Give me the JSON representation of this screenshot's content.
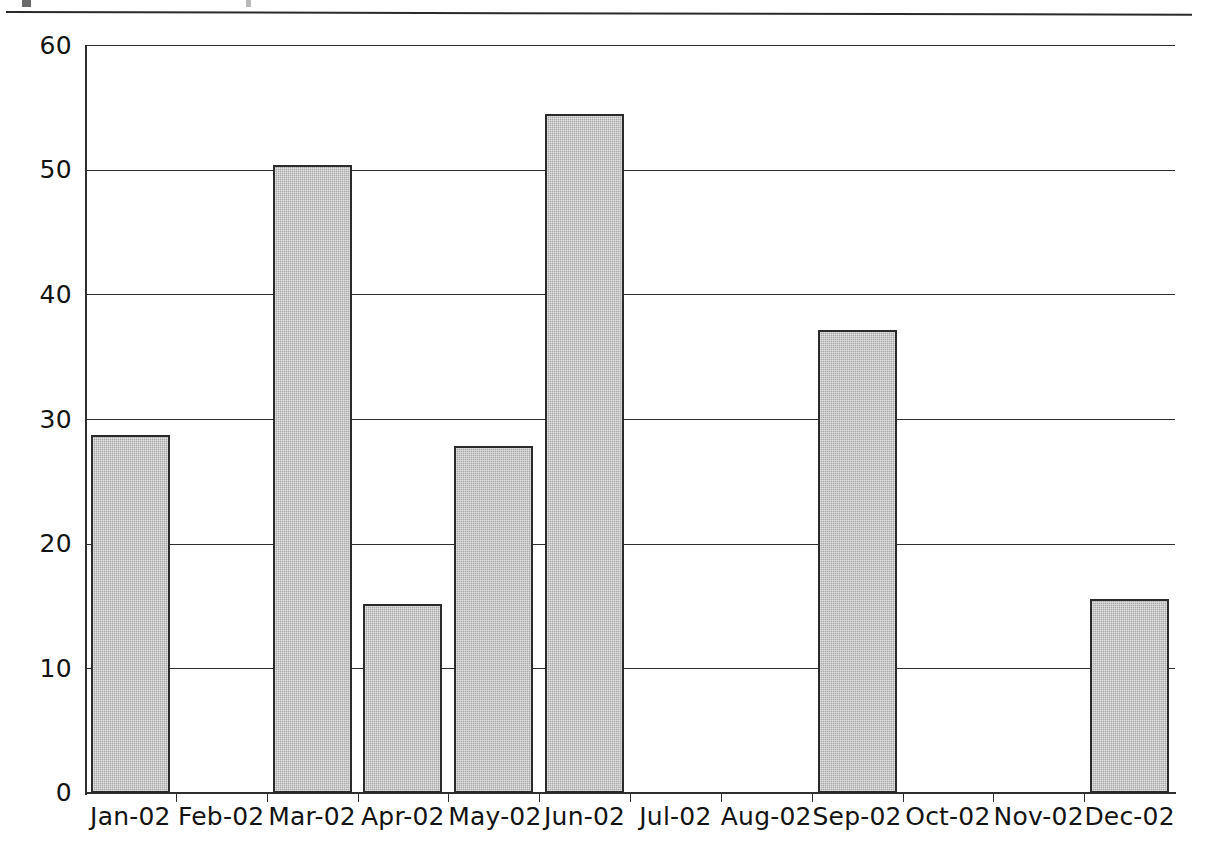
{
  "page": {
    "background": "#ffffff",
    "width": 1210,
    "height": 858
  },
  "figure": {
    "top_rule_present": true,
    "caption_cut_off": true
  },
  "chart_data": {
    "type": "bar",
    "title": "",
    "subtitle": "",
    "xlabel": "",
    "ylabel": "",
    "categories": [
      "Jan-02",
      "Feb-02",
      "Mar-02",
      "Apr-02",
      "May-02",
      "Jun-02",
      "Jul-02",
      "Aug-02",
      "Sep-02",
      "Oct-02",
      "Nov-02",
      "Dec-02"
    ],
    "values": [
      28.7,
      0,
      50.4,
      15.2,
      27.8,
      54.5,
      0,
      0,
      37.1,
      0,
      0,
      15.6
    ],
    "ylim": [
      0,
      60
    ],
    "yticks": [
      0,
      10,
      20,
      30,
      40,
      50,
      60
    ],
    "ytick_labels": [
      "0",
      "10",
      "20",
      "30",
      "40",
      "50",
      "60"
    ],
    "grid": "horizontal",
    "legend": "none",
    "bar_fill_color": "#a9a9a9",
    "bar_border_color": "#2b2b2b",
    "axis_color": "#2f2f2f"
  }
}
